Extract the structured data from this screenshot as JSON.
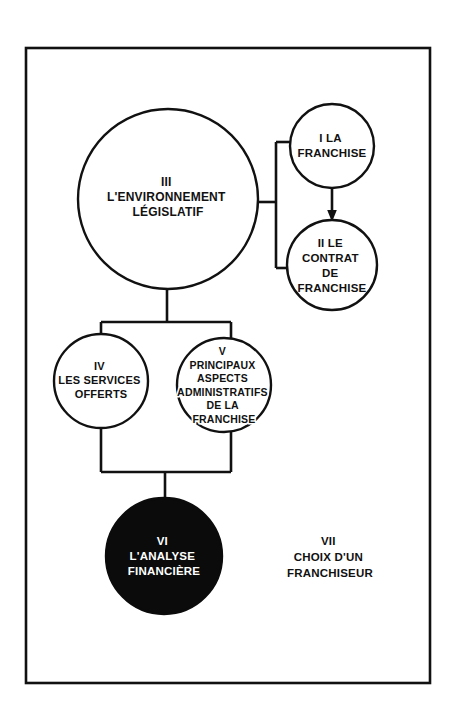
{
  "diagram": {
    "background_color": "#ffffff",
    "line_color": "#111111",
    "filled_node_color": "#0b0b0b",
    "filled_node_text_color": "#ffffff",
    "frame": {
      "x": 26,
      "y": 48,
      "width": 404,
      "height": 635
    },
    "nodes": {
      "n1": {
        "id": "I",
        "shape": "circle",
        "numeral": "I",
        "lines": [
          "I  LA",
          "FRANCHISE"
        ],
        "cx": 332,
        "cy": 146,
        "r": 42,
        "filled": false,
        "font_size": 11.5
      },
      "n2": {
        "id": "II",
        "shape": "circle",
        "numeral": "II",
        "lines": [
          "II  LE",
          "CONTRAT",
          "DE",
          "FRANCHISE"
        ],
        "cx": 332,
        "cy": 265,
        "r": 45,
        "filled": false,
        "font_size": 11.5
      },
      "n3": {
        "id": "III",
        "shape": "circle",
        "numeral": "III",
        "lines": [
          "III",
          "L'ENVIRONNEMENT",
          "LÉGISLATIF"
        ],
        "cx": 168,
        "cy": 199,
        "r": 90,
        "filled": false,
        "font_size": 12
      },
      "n4": {
        "id": "IV",
        "shape": "circle",
        "numeral": "IV",
        "lines": [
          "IV",
          "LES SERVICES",
          "OFFERTS"
        ],
        "cx": 101,
        "cy": 381,
        "r": 47,
        "filled": false,
        "font_size": 11
      },
      "n5": {
        "id": "V",
        "shape": "circle",
        "numeral": "V",
        "lines": [
          "V",
          "PRINCIPAUX",
          "ASPECTS",
          "ADMINISTRATIFS",
          "DE LA",
          "FRANCHISE"
        ],
        "cx": 224,
        "cy": 385,
        "r": 47,
        "filled": false,
        "font_size": 10.5
      },
      "n6": {
        "id": "VI",
        "shape": "circle",
        "numeral": "VI",
        "lines": [
          "VI",
          "L'ANALYSE",
          "FINANCIÈRE"
        ],
        "cx": 164,
        "cy": 556,
        "r": 58,
        "filled": true,
        "font_size": 11.5
      },
      "n7": {
        "id": "VII",
        "shape": "text",
        "numeral": "VII",
        "lines": [
          "VII",
          "CHOIX D'UN",
          "FRANCHISEUR"
        ],
        "cx": 330,
        "cy": 556,
        "r": 0,
        "filled": false,
        "font_size": 11.5
      }
    },
    "connectors": {
      "bracket_right": {
        "description": "bracket from circle III right edge to circles I and II",
        "stub_from_x": 258,
        "stub_to_x": 276,
        "stub_y": 202,
        "spine_x": 276,
        "spine_top_y": 142,
        "spine_bottom_y": 268,
        "top_branch_to_x": 293,
        "top_branch_y": 142,
        "bottom_branch_to_x": 292,
        "bottom_branch_y": 268
      },
      "arrow_i_to_ii": {
        "description": "arrow from circle I down to circle II",
        "x": 332,
        "from_y": 188,
        "to_y": 220,
        "head_width": 9,
        "head_height": 10
      },
      "tree_iii_to_iv_v": {
        "description": "tree from circle III bottom to circles IV and V",
        "trunk_x": 167,
        "trunk_from_y": 289,
        "trunk_to_y": 322,
        "bar_y": 322,
        "bar_left_x": 101,
        "bar_right_x": 231,
        "left_drop_to_y": 337,
        "right_drop_to_y": 340
      },
      "tree_iv_v_to_vi": {
        "description": "merge from circles IV and V down to circle VI",
        "left_x": 101,
        "left_from_y": 427,
        "right_x": 231,
        "right_from_y": 431,
        "bar_y": 472,
        "trunk_x": 165,
        "trunk_to_y": 500
      }
    }
  }
}
